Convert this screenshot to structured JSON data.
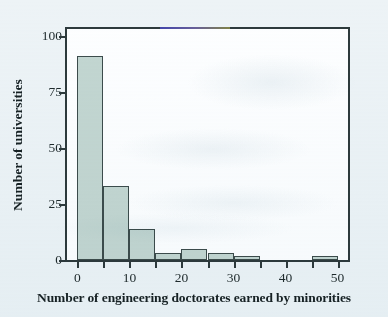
{
  "chart_data": {
    "type": "bar",
    "title": "",
    "subtitle": "",
    "xlabel": "Number of engineering doctorates earned by minorities",
    "ylabel": "Number of universities",
    "xlim": [
      -2,
      52
    ],
    "ylim": [
      0,
      103
    ],
    "grid": false,
    "legend": null,
    "bin_width": 5,
    "x_tick_values": [
      0,
      5,
      10,
      15,
      20,
      25,
      30,
      35,
      40,
      45,
      50
    ],
    "x_tick_labels": [
      "0",
      "",
      "10",
      "",
      "20",
      "",
      "30",
      "",
      "40",
      "",
      "50"
    ],
    "y_tick_values": [
      0,
      25,
      50,
      75,
      100
    ],
    "y_tick_labels": [
      "0",
      "25",
      "50",
      "75",
      "100"
    ],
    "bins": [
      {
        "start": 0,
        "end": 5,
        "label": "0–5",
        "value": 91
      },
      {
        "start": 5,
        "end": 10,
        "label": "5–10",
        "value": 33
      },
      {
        "start": 10,
        "end": 15,
        "label": "10–15",
        "value": 14
      },
      {
        "start": 15,
        "end": 20,
        "label": "15–20",
        "value": 3
      },
      {
        "start": 20,
        "end": 25,
        "label": "20–25",
        "value": 5
      },
      {
        "start": 25,
        "end": 30,
        "label": "25–30",
        "value": 3
      },
      {
        "start": 30,
        "end": 35,
        "label": "30–35",
        "value": 2
      },
      {
        "start": 35,
        "end": 40,
        "label": "35–40",
        "value": 0
      },
      {
        "start": 40,
        "end": 45,
        "label": "40–45",
        "value": 0
      },
      {
        "start": 45,
        "end": 50,
        "label": "45–50",
        "value": 2
      }
    ],
    "categories": [
      "0-5",
      "5-10",
      "10-15",
      "15-20",
      "20-25",
      "25-30",
      "30-35",
      "35-40",
      "40-45",
      "45-50"
    ],
    "values": [
      91,
      33,
      14,
      3,
      5,
      3,
      2,
      0,
      0,
      2
    ],
    "colors": {
      "bar_fill": "#c3d6d1",
      "bar_edge": "#3c4c4c",
      "axis": "#2d3a3c",
      "plot_background": "#fdfeff",
      "page_background": "#edf3f6",
      "text": "#162124"
    }
  }
}
